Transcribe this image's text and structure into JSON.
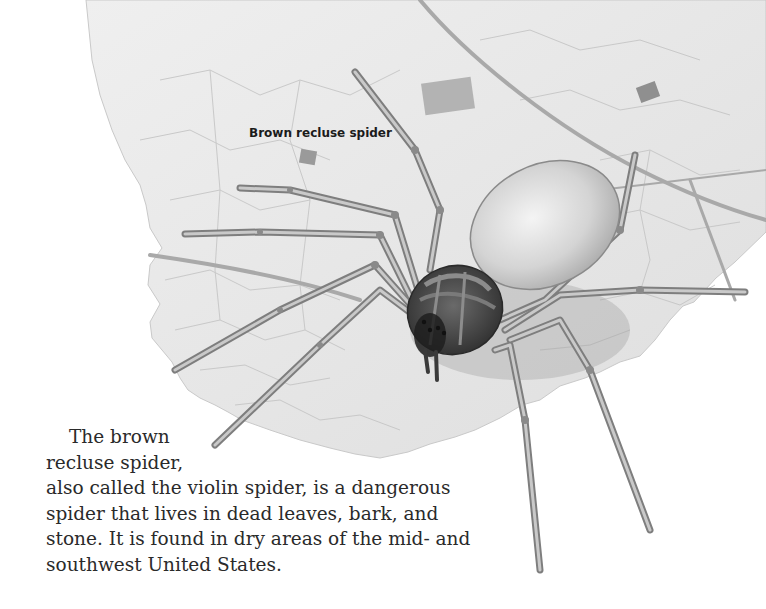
{
  "illustration": {
    "subject": "brown recluse spider on a dead leaf",
    "caption": "Brown recluse spider"
  },
  "body": {
    "paragraph_lines": [
      "The brown",
      "recluse spider,",
      "also called the violin spider, is a dangerous",
      "spider that lives in dead leaves, bark, and",
      "stone. It is found in dry areas of the mid- and",
      "southwest United States."
    ]
  },
  "colors": {
    "background": "#ffffff",
    "leaf": "#e9e9e9",
    "vein": "#b8b8b8",
    "spider_body": "#d6d6d6",
    "cephalothorax": "#4a4a4a",
    "text": "#2a2a2a"
  }
}
